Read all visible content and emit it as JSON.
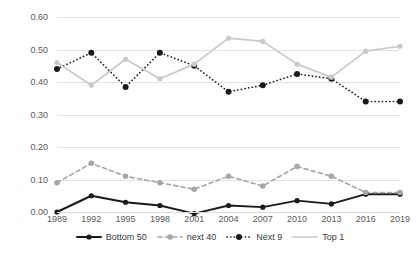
{
  "chart_data": {
    "type": "line",
    "title": "",
    "subtitle": "",
    "xlabel": "",
    "ylabel": "",
    "categories": [
      "1989",
      "1992",
      "1995",
      "1998",
      "2001",
      "2004",
      "2007",
      "2010",
      "2013",
      "2016",
      "2019"
    ],
    "ylim": [
      0.0,
      0.6
    ],
    "yticks": [
      "0.00",
      "0.10",
      "0.20",
      "0.30",
      "0.40",
      "0.50",
      "0.60"
    ],
    "ytick_values": [
      0.0,
      0.1,
      0.2,
      0.3,
      0.4,
      0.5,
      0.6
    ],
    "grid": "horizontal",
    "legend_position": "bottom",
    "series": [
      {
        "name": "Bottom 50",
        "color": "#1a1a1a",
        "line_style": "solid",
        "marker": "circle",
        "values": [
          0.0,
          0.05,
          0.03,
          0.02,
          -0.005,
          0.02,
          0.015,
          0.035,
          0.025,
          0.055,
          0.055
        ]
      },
      {
        "name": "next 40",
        "color": "#a6a6a6",
        "line_style": "dashed",
        "marker": "circle",
        "values": [
          0.09,
          0.15,
          0.11,
          0.09,
          0.07,
          0.11,
          0.08,
          0.14,
          0.11,
          0.06,
          0.06
        ]
      },
      {
        "name": "Next 9",
        "color": "#1a1a1a",
        "line_style": "dotted",
        "marker": "circle",
        "values": [
          0.44,
          0.49,
          0.385,
          0.49,
          0.45,
          0.37,
          0.39,
          0.425,
          0.41,
          0.34,
          0.34
        ]
      },
      {
        "name": "Top 1",
        "color": "#c9c9c9",
        "line_style": "solid",
        "marker": "circle",
        "values": [
          0.46,
          0.39,
          0.47,
          0.41,
          0.455,
          0.535,
          0.525,
          0.455,
          0.415,
          0.495,
          0.51
        ]
      }
    ]
  },
  "legend": {
    "items": [
      {
        "label": "Bottom 50"
      },
      {
        "label": "next 40"
      },
      {
        "label": "Next 9"
      },
      {
        "label": "Top 1"
      }
    ]
  }
}
